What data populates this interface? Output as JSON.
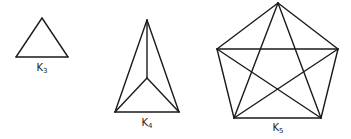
{
  "graphs": [
    {
      "name": "K3",
      "label": "K",
      "subscript": "3",
      "label_pos": [
        42,
        62
      ],
      "vertices": [
        [
          42,
          18
        ],
        [
          16,
          57
        ],
        [
          68,
          57
        ]
      ],
      "edges": [
        [
          0,
          1
        ],
        [
          1,
          2
        ],
        [
          0,
          2
        ]
      ]
    },
    {
      "name": "K4",
      "label": "K",
      "subscript": "4",
      "label_pos": [
        147,
        117
      ],
      "vertices": [
        [
          147,
          20
        ],
        [
          147,
          78
        ],
        [
          115,
          112
        ],
        [
          179,
          112
        ]
      ],
      "edges": [
        [
          0,
          1
        ],
        [
          0,
          2
        ],
        [
          0,
          3
        ],
        [
          1,
          2
        ],
        [
          1,
          3
        ],
        [
          2,
          3
        ]
      ]
    },
    {
      "name": "K5",
      "label": "K",
      "subscript": "5",
      "label_pos": [
        278,
        122
      ],
      "vertices": [
        [
          278,
          3
        ],
        [
          217,
          49
        ],
        [
          338,
          49
        ],
        [
          234,
          118
        ],
        [
          321,
          118
        ]
      ],
      "edges": [
        [
          0,
          1
        ],
        [
          0,
          2
        ],
        [
          0,
          3
        ],
        [
          0,
          4
        ],
        [
          1,
          2
        ],
        [
          1,
          3
        ],
        [
          1,
          4
        ],
        [
          2,
          3
        ],
        [
          2,
          4
        ],
        [
          3,
          4
        ]
      ]
    }
  ],
  "colors": {
    "stroke": "#1a1a1a",
    "background": "#ffffff"
  }
}
